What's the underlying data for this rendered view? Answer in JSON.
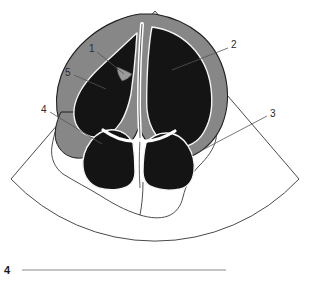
{
  "figure": {
    "kind": "echocardiogram-line-drawing",
    "view_name": "apical four-chamber view",
    "caption_number": "4",
    "colors": {
      "background": "#ffffff",
      "chamber_fill": "#141414",
      "myocardium_fill": "#878787",
      "outline_stroke": "#1e1e1e",
      "sector_stroke": "#4a4a4a",
      "leader_stroke": "#555555",
      "septum_highlight": "#ffffff",
      "label_text": "#2b2b2b",
      "rule_color": "#8a8a8a"
    },
    "sector": {
      "apex_x": 155,
      "apex_y": 11,
      "left_edge_end_x": 11,
      "left_edge_end_y": 179,
      "right_edge_end_x": 299,
      "right_edge_end_y": 179,
      "arc_bottom_x": 155,
      "arc_bottom_y": 222
    },
    "labels": [
      {
        "id": "label-1",
        "text": "1",
        "x": 92,
        "y": 49,
        "leader_to_x": 122,
        "leader_to_y": 72
      },
      {
        "id": "label-2",
        "text": "2",
        "x": 233,
        "y": 45,
        "leader_to_x": 171,
        "leader_to_y": 69
      },
      {
        "id": "label-3",
        "text": "3",
        "x": 272,
        "y": 114,
        "leader_to_x": 190,
        "leader_to_y": 155
      },
      {
        "id": "label-4",
        "text": "4",
        "x": 43,
        "y": 110,
        "leader_to_x": 100,
        "leader_to_y": 143
      },
      {
        "id": "label-5",
        "text": "5",
        "x": 67,
        "y": 73,
        "leader_to_x": 104,
        "leader_to_y": 88
      }
    ],
    "caption": {
      "number": "4",
      "number_x": 6,
      "number_y": 274,
      "rule_x1": 22,
      "rule_x2": 226,
      "rule_y": 270
    }
  }
}
